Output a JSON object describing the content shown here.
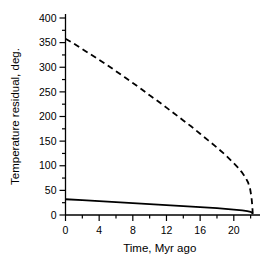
{
  "figure": {
    "background_color": "#ffffff",
    "foreground_color": "#000000"
  },
  "chart_data": {
    "type": "line",
    "title": "",
    "xlabel": "Time, Myr ago",
    "ylabel": "Temperature residual, deg.",
    "xlim": [
      0,
      22.4
    ],
    "ylim": [
      0,
      400
    ],
    "xticks": [
      0,
      4,
      8,
      12,
      16,
      20
    ],
    "xtick_labels": [
      "0",
      "4",
      "8",
      "12",
      "16",
      "20"
    ],
    "xminor_step": 2,
    "yticks": [
      0,
      50,
      100,
      150,
      200,
      250,
      300,
      350,
      400
    ],
    "ytick_labels": [
      "0",
      "50",
      "100",
      "150",
      "200",
      "250",
      "300",
      "350",
      "400"
    ],
    "yminor_step": 25,
    "grid": false,
    "legend": "none",
    "axis_style": "left-and-bottom-spines-ticks-outward",
    "series": [
      {
        "name": "upper-dashed-curve",
        "style": "dashed",
        "color": "#000000",
        "linewidth": 1.8,
        "dash_pattern": "6 4",
        "x": [
          0,
          1,
          2,
          3,
          4,
          5,
          6,
          7,
          8,
          9,
          10,
          11,
          12,
          13,
          14,
          15,
          16,
          17,
          18,
          19,
          20,
          20.5,
          21,
          21.4,
          21.7,
          21.95,
          22.1,
          22.2,
          22.25
        ],
        "values": [
          358,
          348,
          337,
          326,
          315,
          304,
          292,
          280,
          268,
          256,
          243,
          231,
          218,
          205,
          192,
          179,
          165,
          151,
          137,
          122,
          105,
          96,
          86,
          76,
          66,
          52,
          36,
          18,
          3
        ]
      },
      {
        "name": "lower-solid-curve",
        "style": "solid",
        "color": "#000000",
        "linewidth": 1.8,
        "x": [
          0,
          2,
          4,
          6,
          8,
          10,
          12,
          14,
          16,
          18,
          20,
          21,
          21.6,
          22,
          22.2,
          22.25
        ],
        "values": [
          32,
          30,
          28,
          26,
          24,
          22,
          20,
          18,
          16,
          14,
          11,
          9.5,
          8,
          6.5,
          4,
          2
        ]
      }
    ]
  }
}
